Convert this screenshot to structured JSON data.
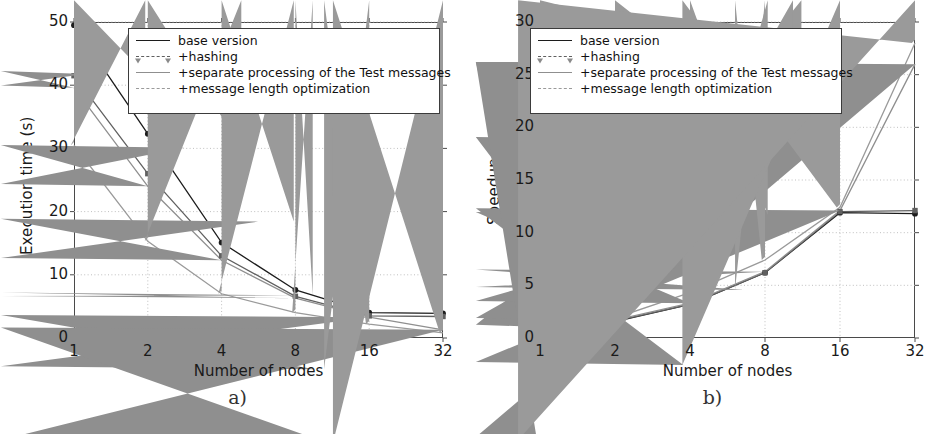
{
  "figure": {
    "background": "#ffffff",
    "series_colors": {
      "base version": "#1c1c1c",
      "+hashing": "#606060",
      "+separate processing of the Test messages": "#8f8f8f",
      "+message length optimization": "#9a9a9a"
    },
    "grid_color": "#b9b9b9",
    "axis_color": "#4a4a4a"
  },
  "panels": [
    {
      "id": "a",
      "caption": "a)",
      "legend": {
        "entries": [
          {
            "label": "base version",
            "marker": "circle",
            "color": "#1c1c1c"
          },
          {
            "label": "+hashing",
            "marker": "square",
            "color": "#606060"
          },
          {
            "label": "+separate processing of the Test messages",
            "marker": "triangle",
            "color": "#8f8f8f"
          },
          {
            "label": "+message length optimization",
            "marker": "diamond",
            "color": "#9a9a9a"
          }
        ]
      }
    },
    {
      "id": "b",
      "caption": "b)",
      "legend": {
        "entries": [
          {
            "label": "base version",
            "marker": "circle",
            "color": "#1c1c1c"
          },
          {
            "label": "+hashing",
            "marker": "square",
            "color": "#606060"
          },
          {
            "label": "+separate processing of the Test messages",
            "marker": "triangle",
            "color": "#8f8f8f"
          },
          {
            "label": "+message length optimization",
            "marker": "diamond",
            "color": "#9a9a9a"
          }
        ]
      }
    }
  ],
  "chart_data": [
    {
      "type": "line",
      "panel": "a",
      "title": "",
      "xlabel": "Number of nodes",
      "ylabel": "Execution time (s)",
      "x": [
        1,
        2,
        4,
        8,
        16,
        32
      ],
      "xticklabels": [
        "1",
        "2",
        "4",
        "8",
        "16",
        "32"
      ],
      "xscale": "log2",
      "xlim": [
        1,
        32
      ],
      "ylim": [
        0,
        50
      ],
      "yticks": [
        0,
        10,
        20,
        30,
        40,
        50
      ],
      "yticklabels": [
        "0",
        "10",
        "20",
        "30",
        "40",
        "50"
      ],
      "grid": true,
      "legend_position": "upper right",
      "series": [
        {
          "name": "base version",
          "marker": "circle",
          "color": "#1c1c1c",
          "values": [
            49.5,
            32.3,
            15.1,
            7.6,
            4.0,
            3.9
          ]
        },
        {
          "name": "+hashing",
          "marker": "square",
          "color": "#606060",
          "values": [
            41.5,
            26.0,
            13.0,
            6.6,
            3.5,
            3.4
          ]
        },
        {
          "name": "+separate processing of the Test messages",
          "marker": "triangle",
          "color": "#8f8f8f",
          "values": [
            39.6,
            24.0,
            12.3,
            6.3,
            3.3,
            1.3
          ]
        },
        {
          "name": "+message length optimization",
          "marker": "diamond",
          "color": "#9a9a9a",
          "values": [
            30.5,
            15.3,
            7.0,
            4.0,
            2.2,
            0.8
          ]
        }
      ]
    },
    {
      "type": "line",
      "panel": "b",
      "title": "",
      "xlabel": "Number of nodes",
      "ylabel": "Speedup",
      "x": [
        1,
        2,
        4,
        8,
        16,
        32
      ],
      "xticklabels": [
        "1",
        "2",
        "4",
        "8",
        "16",
        "32"
      ],
      "xscale": "log2",
      "xlim": [
        1,
        32
      ],
      "ylim": [
        0,
        30
      ],
      "yticks": [
        0,
        5,
        10,
        15,
        20,
        25,
        30
      ],
      "yticklabels": [
        "0",
        "5",
        "10",
        "15",
        "20",
        "25",
        "30"
      ],
      "grid": true,
      "legend_position": "upper left",
      "series": [
        {
          "name": "base version",
          "marker": "circle",
          "color": "#1c1c1c",
          "values": [
            1.0,
            1.55,
            3.2,
            6.2,
            11.9,
            11.8
          ]
        },
        {
          "name": "+hashing",
          "marker": "square",
          "color": "#606060",
          "values": [
            1.0,
            1.6,
            3.2,
            6.2,
            12.0,
            12.1
          ]
        },
        {
          "name": "+separate processing of the Test messages",
          "marker": "triangle",
          "color": "#8f8f8f",
          "values": [
            1.05,
            1.7,
            3.3,
            6.3,
            12.1,
            26.0
          ]
        },
        {
          "name": "+message length optimization",
          "marker": "diamond",
          "color": "#9a9a9a",
          "values": [
            1.1,
            1.9,
            4.3,
            7.4,
            12.4,
            28.0
          ]
        }
      ]
    }
  ]
}
